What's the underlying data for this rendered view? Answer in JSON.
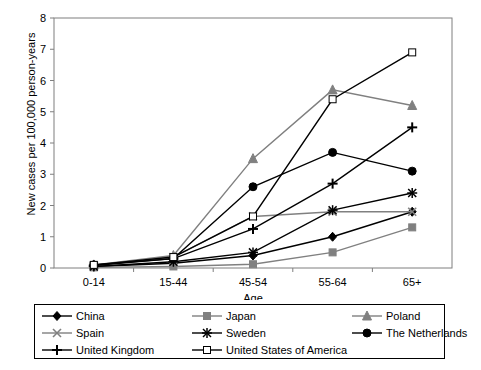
{
  "chart_data": {
    "type": "line",
    "title": "",
    "xlabel": "Age",
    "ylabel": "New cases per 100,000 person-years",
    "categories": [
      "0-14",
      "15-44",
      "45-54",
      "55-64",
      "65+"
    ],
    "ylim": [
      0,
      8
    ],
    "yticks": [
      0,
      1,
      2,
      3,
      4,
      5,
      6,
      7,
      8
    ],
    "grid": false,
    "legend_position": "bottom",
    "series": [
      {
        "name": "China",
        "marker": "diamond-filled",
        "color": "#000000",
        "values": [
          0.05,
          0.15,
          0.4,
          1.0,
          1.8
        ]
      },
      {
        "name": "Japan",
        "marker": "square-filled",
        "color": "#808080",
        "values": [
          0.02,
          0.05,
          0.12,
          0.5,
          1.3
        ]
      },
      {
        "name": "Poland",
        "marker": "triangle-filled",
        "color": "#808080",
        "values": [
          0.1,
          0.4,
          3.5,
          5.7,
          5.2
        ]
      },
      {
        "name": "Spain",
        "marker": "x-cross",
        "color": "#808080",
        "values": [
          0.08,
          0.35,
          1.65,
          1.8,
          1.8
        ]
      },
      {
        "name": "Sweden",
        "marker": "asterisk",
        "color": "#000000",
        "values": [
          0.05,
          0.2,
          0.5,
          1.85,
          2.4
        ]
      },
      {
        "name": "The Netherlands",
        "marker": "circle-filled",
        "color": "#000000",
        "values": [
          0.1,
          0.3,
          2.6,
          3.7,
          3.1
        ]
      },
      {
        "name": "United Kingdom",
        "marker": "plus",
        "color": "#000000",
        "values": [
          0.08,
          0.3,
          1.25,
          2.7,
          4.5
        ]
      },
      {
        "name": "United States of America",
        "marker": "square-open",
        "color": "#000000",
        "values": [
          0.1,
          0.35,
          1.65,
          5.4,
          6.9
        ]
      }
    ]
  },
  "axis": {
    "y_tick_labels": [
      "0",
      "1",
      "2",
      "3",
      "4",
      "5",
      "6",
      "7",
      "8"
    ],
    "x_tick_labels": [
      "0-14",
      "15-44",
      "45-54",
      "55-64",
      "65+"
    ],
    "x_title": "Age",
    "y_title": "New cases per 100,000 person-years"
  },
  "legend": {
    "items": [
      {
        "label": "China"
      },
      {
        "label": "Japan"
      },
      {
        "label": "Poland"
      },
      {
        "label": "Spain"
      },
      {
        "label": "Sweden"
      },
      {
        "label": "The Netherlands"
      },
      {
        "label": "United Kingdom"
      },
      {
        "label": "United States of America"
      }
    ]
  }
}
